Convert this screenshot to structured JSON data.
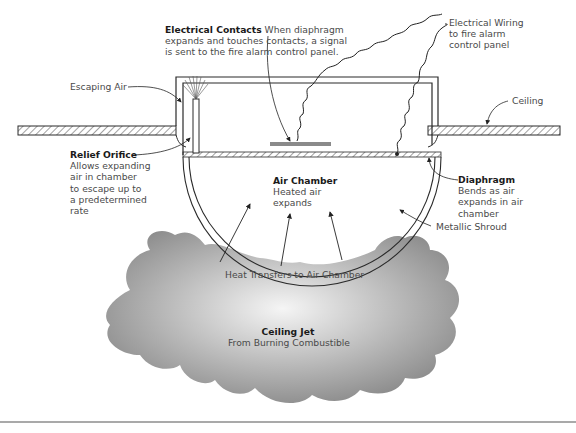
{
  "diagram": {
    "type": "heat detector cross-section (rate-of-rise, diaphragm type)",
    "labels": {
      "electrical_contacts": {
        "title": "Electrical Contacts",
        "line1": "When diaphragm",
        "line2": "expands and touches contacts, a signal",
        "line3": "is sent to the fire alarm control panel."
      },
      "electrical_wiring": {
        "line1": "Electrical Wiring",
        "line2": "to fire alarm",
        "line3": "control panel"
      },
      "escaping_air": "Escaping Air",
      "ceiling": "Ceiling",
      "relief_orifice": {
        "title": "Relief Orifice",
        "line1": "Allows expanding",
        "line2": "air in chamber",
        "line3": "to escape up to",
        "line4": "a predetermined",
        "line5": "rate"
      },
      "air_chamber": {
        "title": "Air Chamber",
        "line1": "Heated air",
        "line2": "expands"
      },
      "diaphragm": {
        "title": "Diaphragm",
        "line1": "Bends as air",
        "line2": "expands in air",
        "line3": "chamber"
      },
      "metallic_shroud": "Metallic Shroud",
      "heat_transfer": "Heat Transfers to Air Chamber",
      "ceiling_jet": {
        "title": "Ceiling Jet",
        "line1": "From Burning Combustible"
      }
    },
    "colors": {
      "line": "#2a2a2a",
      "smoke_light": "#f2f2f2",
      "smoke_dark": "#8c8c8c",
      "contact_plate": "#8a8a8a"
    }
  }
}
